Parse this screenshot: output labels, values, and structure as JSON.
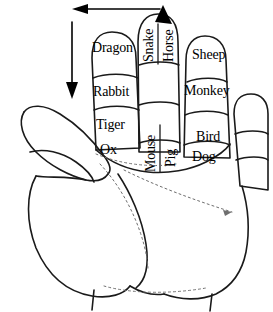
{
  "figure": {
    "ink_color": "#000000",
    "background_color": "#ffffff",
    "width": 273,
    "height": 312
  },
  "labels": {
    "index_finger": {
      "tip": "Dragon",
      "middle": "Rabbit",
      "base": "Tiger",
      "knuckle": "Ox"
    },
    "middle_finger": {
      "tip_left": "Snake",
      "tip_right": "Horse",
      "knuckle_left": "Mouse",
      "knuckle_right": "Pig"
    },
    "ring_finger": {
      "tip": "Sheep",
      "middle": "Monkey",
      "base": "Bird",
      "knuckle": "Dog"
    }
  },
  "annotations": {
    "horizontal_arrow": {
      "name": "leftward-arrow",
      "direction": "left"
    },
    "vertical_arrow": {
      "name": "downward-arrow",
      "direction": "down"
    },
    "middle_tip_arrow": {
      "name": "up-arrowhead",
      "direction": "up"
    }
  }
}
